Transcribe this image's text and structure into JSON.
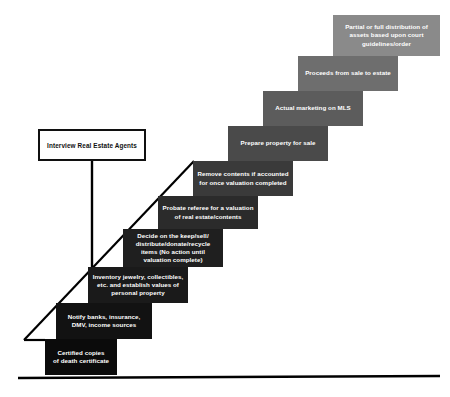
{
  "diagram": {
    "type": "staircase-process-flow",
    "title_visible": false,
    "step_count": 10,
    "direction": "ascending left-to-right",
    "callout": {
      "label": "Interview Real Estate Agents",
      "box_fill": "#ffffff",
      "box_border": "#101010",
      "text_color": "#111111"
    },
    "baseline": {
      "color": "#000000",
      "description": "horizontal ground line"
    },
    "connector": {
      "color": "#000000",
      "description": "diagonal ramp line along staircase with vertical drop from callout box"
    },
    "steps": [
      {
        "index": 1,
        "label": "Certified copies\nof death certificate",
        "fill": "#0b0b0b",
        "text_color": "#ffffff",
        "x": 45,
        "y": 339,
        "w": 72,
        "h": 36
      },
      {
        "index": 2,
        "label": "Notify banks, insurance,\nDMV, income sources",
        "fill": "#121212",
        "text_color": "#ffffff",
        "x": 56,
        "y": 303,
        "w": 96,
        "h": 36
      },
      {
        "index": 3,
        "label": "Inventory jewelry, collectibles,\netc. and establish values of\npersonal property",
        "fill": "#1a1a1a",
        "text_color": "#ffffff",
        "x": 88,
        "y": 267,
        "w": 100,
        "h": 36
      },
      {
        "index": 4,
        "label": "Decide on the keep/sell/\ndistribute/donate/recycle\nitems (No action until\nvaluation complete)",
        "fill": "#1f1f1f",
        "text_color": "#ffffff",
        "x": 123,
        "y": 229,
        "w": 100,
        "h": 38
      },
      {
        "index": 5,
        "label": "Probate referee for a valuation\nof real estate/contents",
        "fill": "#2b2b2b",
        "text_color": "#ffffff",
        "x": 158,
        "y": 196,
        "w": 100,
        "h": 33
      },
      {
        "index": 6,
        "label": "Remove contents if accounted\nfor once valuation completed",
        "fill": "#3a3a3a",
        "text_color": "#ffffff",
        "x": 193,
        "y": 161,
        "w": 100,
        "h": 35
      },
      {
        "index": 7,
        "label": "Prepare property for sale",
        "fill": "#4a4a4a",
        "text_color": "#ffffff",
        "x": 228,
        "y": 126,
        "w": 100,
        "h": 35
      },
      {
        "index": 8,
        "label": "Actual marketing on MLS",
        "fill": "#5c5c5c",
        "text_color": "#ffffff",
        "x": 263,
        "y": 91,
        "w": 100,
        "h": 35
      },
      {
        "index": 9,
        "label": "Proceeds from sale to estate",
        "fill": "#6e6e6e",
        "text_color": "#ffffff",
        "x": 298,
        "y": 56,
        "w": 100,
        "h": 35
      },
      {
        "index": 10,
        "label": "Partial or full distribution of\nassets based upon court\nguidelines/order",
        "fill": "#8a8a8a",
        "text_color": "#ffffff",
        "x": 333,
        "y": 15,
        "w": 107,
        "h": 41
      }
    ]
  }
}
